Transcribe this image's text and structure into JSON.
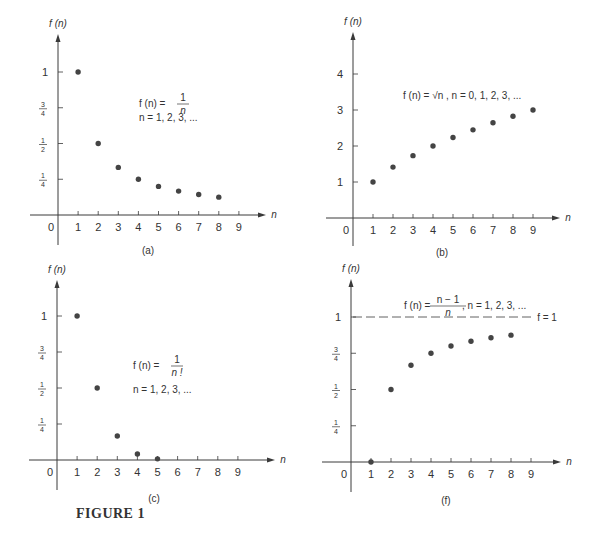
{
  "figure_caption": "FIGURE 1",
  "colors": {
    "ink": "#3a3a3a",
    "dot": "#444444",
    "text": "#333333"
  },
  "chart_data": [
    {
      "id": "a",
      "type": "scatter",
      "panel_label": "(a)",
      "ylabel": "f (n)",
      "xlabel": "n",
      "title": "f(n) = 1/n, n = 1, 2, 3, ...",
      "formula": {
        "lhs": "f (n) = ",
        "num": "1",
        "den": "n",
        "tail": "",
        "line2": "n = 1, 2, 3, ..."
      },
      "x_ticks": [
        "0",
        "1",
        "2",
        "3",
        "4",
        "5",
        "6",
        "7",
        "8",
        "9"
      ],
      "y_ticks": [
        {
          "label": "1/4",
          "num": "1",
          "den": "4",
          "value": 0.25
        },
        {
          "label": "1/2",
          "num": "1",
          "den": "2",
          "value": 0.5
        },
        {
          "label": "3/4",
          "num": "3",
          "den": "4",
          "value": 0.75
        },
        {
          "label": "1",
          "value": 1
        }
      ],
      "x": [
        1,
        2,
        3,
        4,
        5,
        6,
        7,
        8
      ],
      "y": [
        1.0,
        0.5,
        0.333,
        0.25,
        0.2,
        0.167,
        0.143,
        0.125
      ],
      "xlim": [
        0,
        9
      ],
      "ylim": [
        0,
        1
      ],
      "grid": false
    },
    {
      "id": "b",
      "type": "scatter",
      "panel_label": "(b)",
      "ylabel": "f (n)",
      "xlabel": "n",
      "title": "f(n) = √n, n = 0, 1, 2, 3, ...",
      "formula": {
        "text": "f (n) = √n , n = 0, 1, 2, 3, ..."
      },
      "x_ticks": [
        "0",
        "1",
        "2",
        "3",
        "4",
        "5",
        "6",
        "7",
        "8",
        "9"
      ],
      "y_ticks": [
        {
          "label": "1",
          "value": 1
        },
        {
          "label": "2",
          "value": 2
        },
        {
          "label": "3",
          "value": 3
        },
        {
          "label": "4",
          "value": 4
        }
      ],
      "x": [
        1,
        2,
        3,
        4,
        5,
        6,
        7,
        8,
        9
      ],
      "y": [
        1.0,
        1.414,
        1.732,
        2.0,
        2.236,
        2.449,
        2.646,
        2.828,
        3.0
      ],
      "xlim": [
        0,
        9
      ],
      "ylim": [
        0,
        4
      ],
      "grid": false
    },
    {
      "id": "c",
      "type": "scatter",
      "panel_label": "(c)",
      "ylabel": "f (n)",
      "xlabel": "n",
      "title": "f(n) = 1/n!, n = 1, 2, 3, ...",
      "formula": {
        "lhs": "f (n) = ",
        "num": "1",
        "den": "n !",
        "tail": "",
        "line2": "n = 1, 2, 3, ..."
      },
      "x_ticks": [
        "0",
        "1",
        "2",
        "3",
        "4",
        "5",
        "6",
        "7",
        "8",
        "9"
      ],
      "y_ticks": [
        {
          "label": "1/4",
          "num": "1",
          "den": "4",
          "value": 0.25
        },
        {
          "label": "1/2",
          "num": "1",
          "den": "2",
          "value": 0.5
        },
        {
          "label": "3/4",
          "num": "3",
          "den": "4",
          "value": 0.75
        },
        {
          "label": "1",
          "value": 1
        }
      ],
      "x": [
        1,
        2,
        3,
        4,
        5
      ],
      "y": [
        1.0,
        0.5,
        0.167,
        0.042,
        0.008
      ],
      "xlim": [
        0,
        9
      ],
      "ylim": [
        0,
        1
      ],
      "grid": false
    },
    {
      "id": "f",
      "type": "scatter",
      "panel_label": "(f)",
      "ylabel": "f (n)",
      "xlabel": "n",
      "title": "f(n) = (n−1)/n, n = 1, 2, 3, ...",
      "formula": {
        "lhs": "f (n) = ",
        "num": "n − 1",
        "den": "n",
        "tail": " , n = 1, 2, 3, ..."
      },
      "asymptote": {
        "value": 1,
        "label": "f = 1",
        "style": "dashed"
      },
      "x_ticks": [
        "0",
        "1",
        "2",
        "3",
        "4",
        "5",
        "6",
        "7",
        "8",
        "9"
      ],
      "y_ticks": [
        {
          "label": "1/4",
          "num": "1",
          "den": "4",
          "value": 0.25
        },
        {
          "label": "1/2",
          "num": "1",
          "den": "2",
          "value": 0.5
        },
        {
          "label": "3/4",
          "num": "3",
          "den": "4",
          "value": 0.75
        },
        {
          "label": "1",
          "value": 1
        }
      ],
      "x": [
        1,
        2,
        3,
        4,
        5,
        6,
        7,
        8
      ],
      "y": [
        0.0,
        0.5,
        0.667,
        0.75,
        0.8,
        0.833,
        0.857,
        0.875
      ],
      "xlim": [
        0,
        9
      ],
      "ylim": [
        0,
        1
      ],
      "grid": false
    }
  ]
}
